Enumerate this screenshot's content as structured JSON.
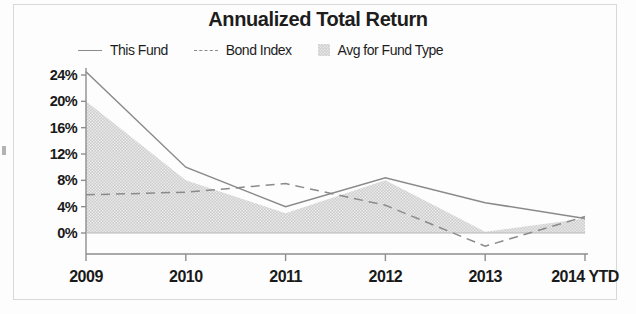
{
  "chart_data": {
    "type": "area",
    "title": "Annualized Total Return",
    "xlabel": "",
    "ylabel": "",
    "grid": false,
    "legend_position": "top",
    "categories": [
      "2009",
      "2010",
      "2011",
      "2012",
      "2013",
      "2014 YTD"
    ],
    "x_tick_labels": [
      "2009",
      "2010",
      "2011",
      "2012",
      "2013",
      "2014 YTD"
    ],
    "y_tick_labels": [
      "24%",
      "20%",
      "16%",
      "12%",
      "8%",
      "4%",
      "0%"
    ],
    "y_tick_values": [
      24,
      20,
      16,
      12,
      8,
      4,
      0
    ],
    "ylim": [
      -4,
      26
    ],
    "yunit": "%",
    "series": [
      {
        "name": "This Fund",
        "style": "solid-line",
        "color": "#8a8a8a",
        "values": [
          24.5,
          10.0,
          4.0,
          8.4,
          4.6,
          2.2
        ]
      },
      {
        "name": "Bond Index",
        "style": "dashed-line",
        "color": "#8a8a8a",
        "values": [
          5.8,
          6.2,
          7.5,
          4.2,
          -2.0,
          2.5
        ]
      },
      {
        "name": "Avg for Fund Type",
        "style": "filled-area",
        "color": "#cfcfcf",
        "values": [
          20.0,
          8.0,
          3.0,
          8.0,
          0.2,
          2.2
        ]
      }
    ]
  },
  "legend": {
    "items": [
      {
        "label": "This Fund",
        "swatch": "solid-line-swatch"
      },
      {
        "label": "Bond Index",
        "swatch": "dashed-line-swatch"
      },
      {
        "label": "Avg for Fund Type",
        "swatch": "area-fill-swatch"
      }
    ]
  },
  "axes": {
    "y_labels": [
      "24%",
      "20%",
      "16%",
      "12%",
      "8%",
      "4%",
      "0%"
    ],
    "x_labels": [
      "2009",
      "2010",
      "2011",
      "2012",
      "2013",
      "2014 YTD"
    ]
  }
}
